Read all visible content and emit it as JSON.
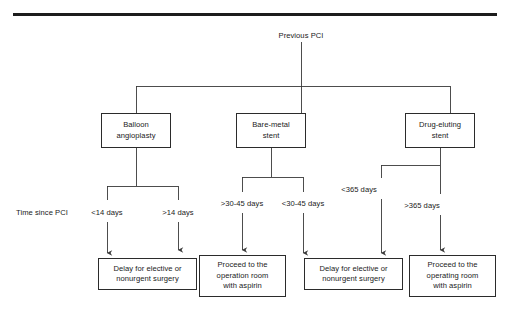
{
  "figure": {
    "kind": "clinical-decision-flowchart",
    "root": {
      "label": "Previous PCI",
      "x": 301,
      "y": 31
    },
    "top_rule": {
      "x": 13,
      "y": 13,
      "width": 484,
      "height": 3,
      "color": "#1c1c1c"
    },
    "row_label": {
      "text": "Time since PCI",
      "x": 16,
      "y": 212
    },
    "stent_nodes": [
      {
        "id": "balloon",
        "label_line1": "Balloon",
        "label_line2": "angioplasty",
        "x": 101,
        "y": 113,
        "w": 70,
        "h": 35
      },
      {
        "id": "bare-metal",
        "label_line1": "Bare-metal",
        "label_line2": "stent",
        "x": 236,
        "y": 113,
        "w": 70,
        "h": 35
      },
      {
        "id": "drug-eluting",
        "label_line1": "Drug-eluting",
        "label_line2": "stent",
        "x": 405,
        "y": 113,
        "w": 70,
        "h": 35
      }
    ],
    "time_labels": [
      {
        "id": "lt14",
        "text": "<14 days",
        "x": 107,
        "y": 212
      },
      {
        "id": "gt14",
        "text": ">14 days",
        "x": 178,
        "y": 212
      },
      {
        "id": "gt3045",
        "text": ">30-45 days",
        "x": 242,
        "y": 203
      },
      {
        "id": "lt3045",
        "text": "<30-45 days",
        "x": 303,
        "y": 203
      },
      {
        "id": "lt365",
        "text": "<365 days",
        "x": 359,
        "y": 189
      },
      {
        "id": "gt365",
        "text": ">365 days",
        "x": 422,
        "y": 205
      }
    ],
    "outcome_nodes": [
      {
        "id": "delay-left",
        "line1": "Delay for elective or",
        "line2": "nonurgent surgery",
        "line3": "",
        "x": 98,
        "y": 258,
        "w": 99,
        "h": 32
      },
      {
        "id": "proceed-left",
        "line1": "Proceed to the",
        "line2": "operation room",
        "line3": "with aspirin",
        "x": 199,
        "y": 255,
        "w": 87,
        "h": 42
      },
      {
        "id": "delay-right",
        "line1": "Delay for elective or",
        "line2": "nonurgent surgery",
        "line3": "",
        "x": 304,
        "y": 258,
        "w": 99,
        "h": 32
      },
      {
        "id": "proceed-right",
        "line1": "Proceed to the",
        "line2": "operating room",
        "line3": "with aspirin",
        "x": 409,
        "y": 255,
        "w": 87,
        "h": 42
      }
    ],
    "colors": {
      "line": "#3a3a3a",
      "box_border": "#2b2b2b",
      "text": "#1a1a1a",
      "background": "#ffffff"
    }
  }
}
